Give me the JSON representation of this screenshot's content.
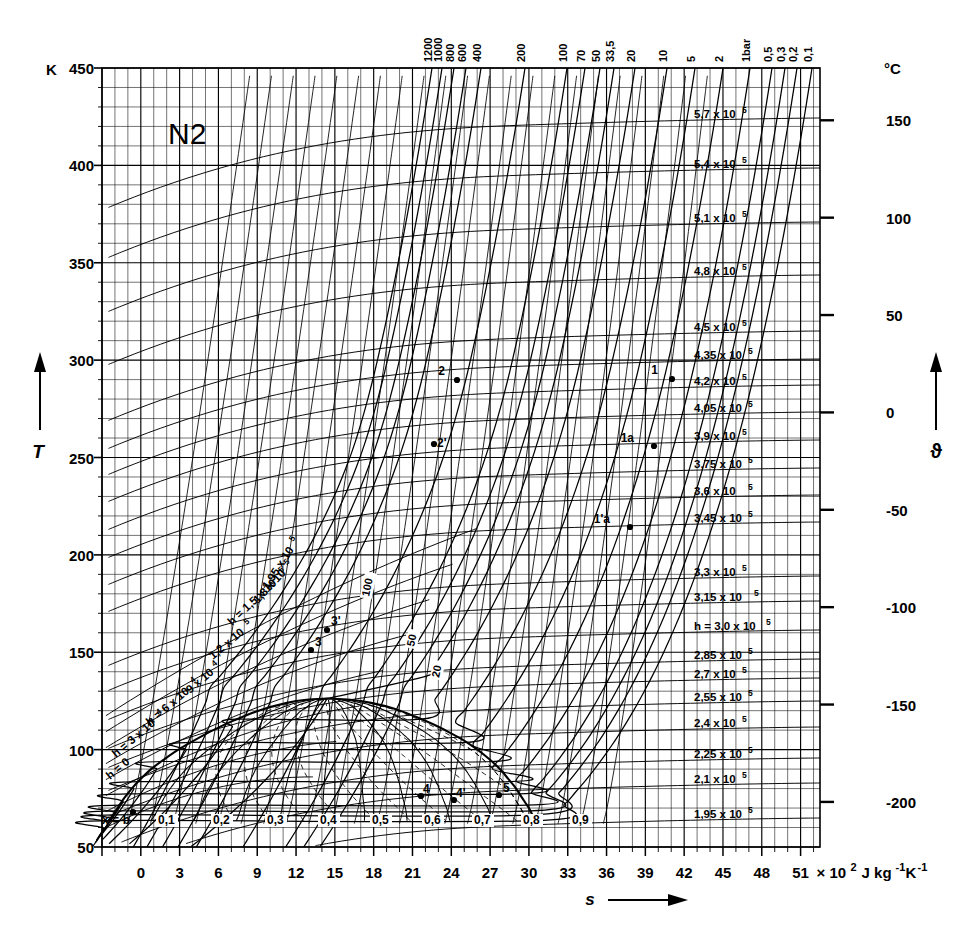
{
  "title": "N2",
  "axes": {
    "y_left": {
      "unit": "K",
      "symbol": "T",
      "ticks": [
        450,
        400,
        350,
        300,
        250,
        200,
        150,
        100,
        50
      ],
      "min": 50,
      "max": 450,
      "minor_step": 10
    },
    "y_right": {
      "unit": "°C",
      "symbol": "ϑ",
      "ticks": [
        150,
        100,
        50,
        0,
        -50,
        -100,
        -150,
        -200
      ]
    },
    "x_bottom": {
      "symbol": "s",
      "unit": "× 10",
      "unit_exp": "2",
      "unit_tail": "J kg",
      "unit_tail_exp1": "-1",
      "unit_tail_mid": "K",
      "unit_tail_exp2": "-1",
      "ticks": [
        0,
        3,
        6,
        9,
        12,
        15,
        18,
        21,
        24,
        27,
        30,
        33,
        36,
        39,
        42,
        45,
        48,
        51
      ],
      "min": -3,
      "max": 52.5,
      "minor_step": 1
    }
  },
  "chart_data": {
    "type": "line",
    "title": "N2",
    "xlabel": "s × 10² J kg⁻¹ K⁻¹",
    "ylabel": "T / K",
    "xlim": [
      -3,
      52.5
    ],
    "ylim": [
      50,
      450
    ],
    "grid": true,
    "legend": "none",
    "isobars_bar": [
      "1200",
      "1000",
      "800",
      "600",
      "400",
      "200",
      "100",
      "70",
      "50",
      "33,5",
      "20",
      "10",
      "5",
      "2",
      "1bar",
      "0,5",
      "0,3",
      "0,2",
      "0,1"
    ],
    "isobars_x_at_top": [
      432,
      442,
      454,
      466,
      481,
      525,
      567,
      585,
      600,
      614,
      635,
      667,
      695,
      723,
      750,
      772,
      785,
      797,
      812
    ],
    "isenthalps_right": [
      {
        "label": "5,7 x 10",
        "exp": "5",
        "y": 118
      },
      {
        "label": "5,4 x 10",
        "exp": "5",
        "y": 168
      },
      {
        "label": "5,1 x 10",
        "exp": "5",
        "y": 222
      },
      {
        "label": "4,8 x 10",
        "exp": "5",
        "y": 275
      },
      {
        "label": "4,5 x 10",
        "exp": "5",
        "y": 331
      },
      {
        "label": "4,35 x 10",
        "exp": "5",
        "y": 359
      },
      {
        "label": "4,2 x 10",
        "exp": "5",
        "y": 385
      },
      {
        "label": "4,05 x 10",
        "exp": "5",
        "y": 412
      },
      {
        "label": "3,9 x 10",
        "exp": "5",
        "y": 440
      },
      {
        "label": "3,75 x 10",
        "exp": "5",
        "y": 468
      },
      {
        "label": "3,6  x 10",
        "exp": "5",
        "y": 495
      },
      {
        "label": "3,45 x 10",
        "exp": "5",
        "y": 522
      },
      {
        "label": "3,3 x 10",
        "exp": "5",
        "y": 576
      },
      {
        "label": "3,15  x 10",
        "exp": "5",
        "y": 601
      },
      {
        "label": "h = 3,0 x 10",
        "exp": "5",
        "y": 630
      },
      {
        "label": "2,85 x 10",
        "exp": "5",
        "y": 659
      },
      {
        "label": "2,7 x 10",
        "exp": "5",
        "y": 678
      },
      {
        "label": "2,55 x 10",
        "exp": "5",
        "y": 701
      },
      {
        "label": "2,4 x 10",
        "exp": "5",
        "y": 727
      },
      {
        "label": "2,25 x 10",
        "exp": "5",
        "y": 758
      },
      {
        "label": "2,1 x 10",
        "exp": "5",
        "y": 783
      },
      {
        "label": "1,95 x 10",
        "exp": "5",
        "y": 818
      }
    ],
    "isenthalps_left": [
      {
        "label": "1,95 x 10",
        "exp": "5",
        "x": 268,
        "y": 590,
        "rot": -57
      },
      {
        "label": "1,8 x 10",
        "exp": "5",
        "x": 258,
        "y": 604,
        "rot": -47
      },
      {
        "label": "h = 1,5 x 10",
        "exp": "5",
        "x": 232,
        "y": 626,
        "rot": -43
      },
      {
        "label": "1,2 x 10",
        "exp": "5",
        "x": 213,
        "y": 660,
        "rot": -40
      },
      {
        "label": "9 x 10",
        "exp": "4",
        "x": 190,
        "y": 694,
        "rot": -40
      },
      {
        "label": "h = 6 x 10",
        "exp": "4",
        "x": 150,
        "y": 726,
        "rot": -40
      },
      {
        "label": "h = 3 x 10",
        "exp": "4",
        "x": 116,
        "y": 758,
        "rot": -40
      },
      {
        "label": "h = 0",
        "exp": "",
        "x": 110,
        "y": 780,
        "rot": -40
      }
    ],
    "inner_isobar_labels": [
      {
        "label": "100",
        "x": 369,
        "y": 597,
        "rot": -78
      },
      {
        "label": "50",
        "x": 414,
        "y": 647,
        "rot": -78
      },
      {
        "label": "20",
        "x": 439,
        "y": 678,
        "rot": -78
      }
    ],
    "quality_label": "x =",
    "quality_values": [
      "0,1",
      "0,2",
      "0,3",
      "0,4",
      "0,5",
      "0,6",
      "0,7",
      "0,8",
      "0,9"
    ],
    "quality_x": [
      158,
      213,
      267,
      320,
      372,
      424,
      474,
      523,
      572
    ],
    "state_points": [
      {
        "name": "1",
        "x": 672,
        "y": 379,
        "lx": -14,
        "ly": -5
      },
      {
        "name": "2",
        "x": 457,
        "y": 380,
        "lx": -12,
        "ly": -5
      },
      {
        "name": "1a",
        "x": 654,
        "y": 446,
        "lx": -20,
        "ly": -4
      },
      {
        "name": "2'",
        "x": 434,
        "y": 444,
        "lx": 3,
        "ly": 3
      },
      {
        "name": "1'a",
        "x": 630,
        "y": 527,
        "lx": -20,
        "ly": -4
      },
      {
        "name": "3'",
        "x": 327,
        "y": 630,
        "lx": 4,
        "ly": -5
      },
      {
        "name": "3",
        "x": 311,
        "y": 650,
        "lx": 4,
        "ly": -4
      },
      {
        "name": "4",
        "x": 421,
        "y": 796,
        "lx": 2,
        "ly": -3
      },
      {
        "name": "4'",
        "x": 454,
        "y": 800,
        "lx": 2,
        "ly": -3
      },
      {
        "name": "5",
        "x": 499,
        "y": 795,
        "lx": 4,
        "ly": -3
      },
      {
        "name": "b",
        "x": 133,
        "y": 812,
        "lx": -3,
        "ly": 12
      }
    ]
  }
}
